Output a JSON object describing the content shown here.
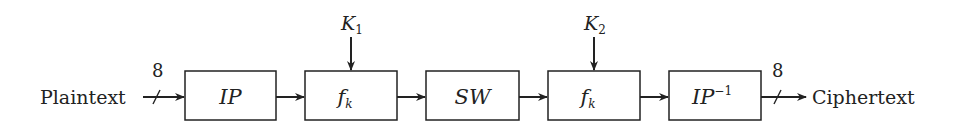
{
  "diagram": {
    "input_label": "Plaintext",
    "output_label": "Ciphertext",
    "input_bits": "8",
    "output_bits": "8",
    "blocks": [
      {
        "id": "ip",
        "label": "IP",
        "sup": "",
        "sub": ""
      },
      {
        "id": "fk1",
        "label": "f",
        "sup": "",
        "sub": "k"
      },
      {
        "id": "sw",
        "label": "SW",
        "sup": "",
        "sub": ""
      },
      {
        "id": "fk2",
        "label": "f",
        "sup": "",
        "sub": "k"
      },
      {
        "id": "ip-inv",
        "label": "IP",
        "sup": "−1",
        "sub": ""
      }
    ],
    "keys": [
      {
        "label": "K",
        "sub": "1",
        "target": "fk1"
      },
      {
        "label": "K",
        "sub": "2",
        "target": "fk2"
      }
    ],
    "colors": {
      "stroke": "#222222",
      "background": "#ffffff"
    }
  }
}
